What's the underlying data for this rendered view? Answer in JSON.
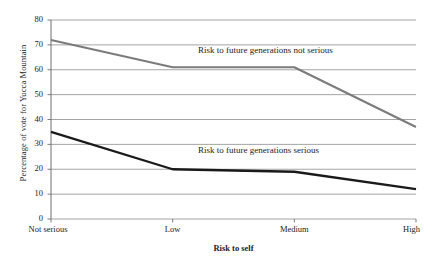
{
  "chart_data": {
    "type": "line",
    "title": "",
    "subtitle": "",
    "xlabel": "Risk to self",
    "ylabel": "Percentage of vote for Yucca Mountain",
    "categories": [
      "Not serious",
      "Low",
      "Medium",
      "High"
    ],
    "ylim": [
      0,
      80
    ],
    "ytick_step": 10,
    "yticks": [
      0,
      10,
      20,
      30,
      40,
      50,
      60,
      70,
      80
    ],
    "grid": true,
    "grid_axis": "y",
    "legend_position": "inline-annotations",
    "series": [
      {
        "name": "Risk to future generations not serious",
        "values": [
          72,
          61,
          61,
          37
        ],
        "color": "#7b7b7b"
      },
      {
        "name": "Risk to future generations serious",
        "values": [
          35,
          20,
          19,
          12
        ],
        "color": "#1a1a1a"
      }
    ],
    "annotations": [
      {
        "text": "Risk to future generations not serious",
        "series": "Risk to future generations not serious"
      },
      {
        "text": "Risk to future generations serious",
        "series": "Risk to future generations serious"
      }
    ]
  },
  "colors": {
    "series_gray": "#7b7b7b",
    "series_black": "#1a1a1a",
    "gridline": "#9a9a9a",
    "axis": "#6e6e6e",
    "text": "#1b1b1b",
    "background": "#ffffff"
  }
}
